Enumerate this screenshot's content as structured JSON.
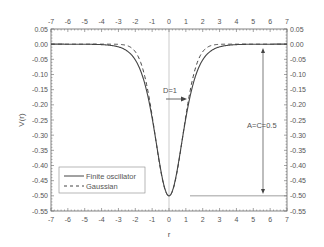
{
  "chart_data": {
    "type": "line",
    "title": "",
    "xlabel": "r",
    "ylabel": "V(r)",
    "xlim": [
      -7,
      7
    ],
    "ylim": [
      -0.55,
      0.05
    ],
    "xticks": [
      -7,
      -6,
      -5,
      -4,
      -3,
      -2,
      -1,
      0,
      1,
      2,
      3,
      4,
      5,
      6,
      7
    ],
    "yticks": [
      "0.05",
      "0.00",
      "-0.05",
      "-0.10",
      "-0.15",
      "-0.20",
      "-0.25",
      "-0.30",
      "-0.35",
      "-0.40",
      "-0.45",
      "-0.50",
      "-0.55"
    ],
    "grid": false,
    "legend_position": "lower left",
    "series": [
      {
        "name": "Finite oscillator",
        "style": "solid",
        "x": [
          -7,
          -6,
          -5,
          -4,
          -3,
          -2.5,
          -2,
          -1.5,
          -1,
          -0.5,
          0,
          0.5,
          1,
          1.5,
          2,
          2.5,
          3,
          4,
          5,
          6,
          7
        ],
        "values": [
          0.0,
          0.0,
          -0.0002,
          -0.0013,
          -0.0099,
          -0.0266,
          -0.0707,
          -0.1812,
          -0.21,
          -0.3932,
          -0.5,
          -0.3932,
          -0.21,
          -0.1812,
          -0.0707,
          -0.0266,
          -0.0099,
          -0.0013,
          -0.0002,
          0.0,
          0.0
        ]
      },
      {
        "name": "Gaussian",
        "style": "dashed",
        "x": [
          -7,
          -3,
          -2.5,
          -2,
          -1.5,
          -1,
          -0.5,
          0,
          0.5,
          1,
          1.5,
          2,
          2.5,
          3,
          7
        ],
        "values": [
          0.0,
          -0.0001,
          -0.001,
          -0.0092,
          -0.0527,
          -0.1839,
          -0.3894,
          -0.5,
          -0.3894,
          -0.1839,
          -0.0527,
          -0.0092,
          -0.001,
          -0.0001,
          0.0
        ]
      }
    ],
    "annotations": [
      {
        "text": "D=1",
        "x": -0.2,
        "y": -0.15,
        "arrow": "right"
      },
      {
        "text": "A=C=0.5",
        "x": 5.5,
        "y": -0.26,
        "arrow": "vertical double from 0.00 to -0.50"
      }
    ]
  },
  "legend": {
    "items": [
      {
        "label": "Finite oscillator",
        "style": "solid"
      },
      {
        "label": "Gaussian",
        "style": "dashed"
      }
    ]
  },
  "annotations": {
    "d_label": "D=1",
    "ac_label": "A=C=0.5"
  },
  "axes": {
    "xlabel": "r",
    "ylabel": "V(r)"
  },
  "colors": {
    "line": "#444444",
    "axis": "#666666",
    "text": "#555555"
  }
}
